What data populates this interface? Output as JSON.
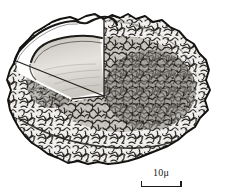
{
  "figure": {
    "kind": "scientific-illustration",
    "background_color": "#ffffff",
    "ink_color": "#1b1b1b",
    "title": ""
  },
  "specimen": {
    "outer_shell_name": "agglutinated rough shell",
    "outer_shell_texture": "vermiculate stipple",
    "inner_body_name": "smooth internal capsule",
    "inner_body_fill": "#d9d6d0",
    "cutaway_name": "cut-away wedge",
    "cutaway_fill": "#ffffff",
    "shell_light_fill": "#efeeec",
    "shell_mid_fill": "#b9b6b1",
    "shell_dark_fill": "#6e6b67"
  },
  "scalebar": {
    "value": "10",
    "unit": "μ",
    "label": "10μ",
    "length_px": 41,
    "represents": "10 micrometres"
  }
}
